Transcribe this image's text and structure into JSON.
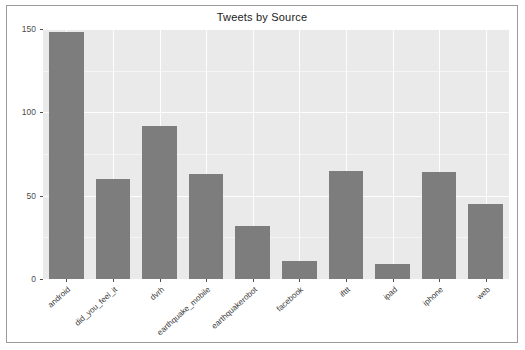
{
  "chart_data": {
    "type": "bar",
    "title": "Tweets by Source",
    "xlabel": "",
    "ylabel": "Number of tweets",
    "ylim": [
      0,
      150
    ],
    "yticks": [
      0,
      50,
      100,
      150
    ],
    "ytick_labels": [
      "0",
      "50",
      "100",
      "150"
    ],
    "grid": true,
    "legend": "none",
    "bar_color": "#7d7d7d",
    "panel_color": "#eaeaea",
    "categories": [
      "android",
      "did_you_feel_it",
      "dvrh",
      "earthquake_mobile",
      "earthquakerobot",
      "facebook",
      "ifttt",
      "ipad",
      "iphone",
      "web"
    ],
    "values": [
      148,
      60,
      92,
      63,
      32,
      11,
      65,
      9,
      64,
      45
    ]
  },
  "frame": {
    "border_color": "#9a9a9a",
    "background": "#ffffff"
  }
}
